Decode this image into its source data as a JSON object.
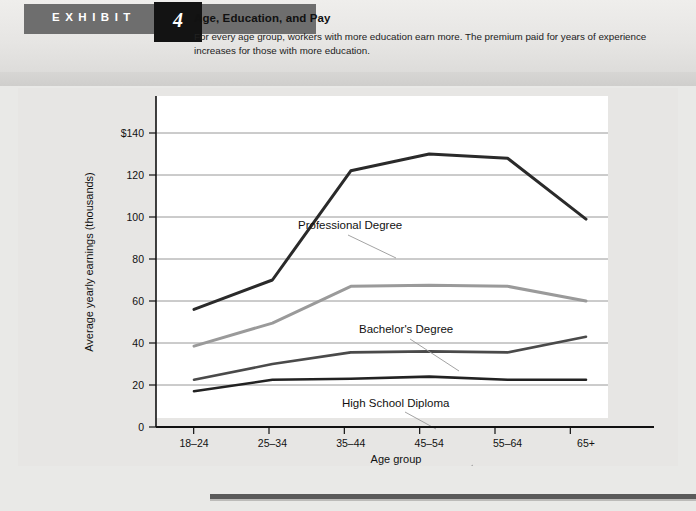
{
  "header": {
    "exhibit_word": "EXHIBIT",
    "exhibit_number": "4",
    "title": "Age, Education, and Pay",
    "subtitle_line1": "For every age group, workers with more education earn more. The premium paid for years of experience increases",
    "subtitle_line2": "for those with more education.",
    "banner_color": "#6e6e6e",
    "number_box_color": "#131313"
  },
  "chart_data": {
    "type": "line",
    "title": "Age, Education, and Pay",
    "xlabel": "Age group",
    "ylabel": "Average yearly earnings (thousands)",
    "categories": [
      "18–24",
      "25–34",
      "35–44",
      "45–54",
      "55–64",
      "65+"
    ],
    "ylim": [
      0,
      140
    ],
    "ytick_labels": [
      "0",
      "20",
      "40",
      "60",
      "80",
      "100",
      "120",
      "$140"
    ],
    "ytick_values": [
      0,
      20,
      40,
      60,
      80,
      100,
      120,
      140
    ],
    "grid": true,
    "legend": "inline-labels",
    "series": [
      {
        "name": "Professional Degree",
        "values": [
          56,
          70,
          122,
          130,
          128,
          99
        ],
        "color": "#2a2a2a",
        "width": 3.0,
        "label_x": 280,
        "label_y": 141,
        "leader": [
          [
            330,
            147
          ],
          [
            378,
            170
          ]
        ]
      },
      {
        "name": "Bachelor's Degree",
        "values": [
          38.5,
          49.5,
          67,
          67.5,
          67,
          60
        ],
        "color": "#9a9a9a",
        "width": 3.0,
        "label_x": 341,
        "label_y": 245,
        "leader": [
          [
            392,
            251
          ],
          [
            441,
            283
          ]
        ]
      },
      {
        "name": "High School Diploma",
        "values": [
          22.5,
          30,
          35.5,
          36,
          35.5,
          43
        ],
        "color": "#4a4a4a",
        "width": 2.6,
        "label_x": 324,
        "label_y": 319,
        "leader": [
          [
            387,
            324
          ],
          [
            418,
            341
          ]
        ]
      },
      {
        "name": "Less Than Ninth Grade",
        "values": [
          17,
          22.5,
          23,
          24,
          22.5,
          22.5
        ],
        "color": "#222222",
        "width": 2.6,
        "label_x": 361,
        "label_y": 407,
        "leader": [
          [
            430,
            394
          ],
          [
            455,
            377
          ]
        ]
      }
    ]
  }
}
